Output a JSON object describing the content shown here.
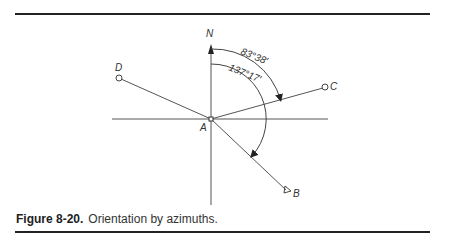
{
  "figure": {
    "number": "Figure 8-20.",
    "caption": "Orientation by azimuths."
  },
  "diagram": {
    "origin_label": "A",
    "north_label": "N",
    "points": {
      "B": "B",
      "C": "C",
      "D": "D"
    },
    "angles": {
      "to_C": "83°38′",
      "to_B": "137°17′"
    }
  }
}
